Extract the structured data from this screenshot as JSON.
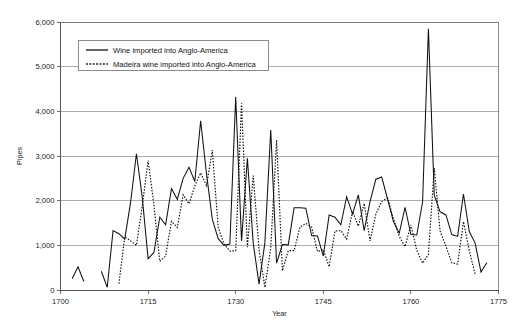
{
  "chart_data": {
    "type": "line",
    "title": "",
    "xlabel": "Year",
    "ylabel": "Pipes",
    "xlim": [
      1700,
      1775
    ],
    "ylim": [
      0,
      6000
    ],
    "grid": true,
    "legend_position": "top-left-inside",
    "xticks": [
      1700,
      1715,
      1730,
      1745,
      1760,
      1775
    ],
    "xtick_labels": [
      "1700",
      "1715",
      "1730",
      "1745",
      "1760",
      "1775"
    ],
    "yticks": [
      0,
      1000,
      2000,
      3000,
      4000,
      5000,
      6000
    ],
    "ytick_labels": [
      "0",
      "1,000",
      "2,000",
      "3,000",
      "4,000",
      "5,000",
      "6,000"
    ],
    "series": [
      {
        "name": "Wine imported into Anglo-America",
        "style": "solid",
        "segments": [
          {
            "x": [
              1702,
              1703,
              1704
            ],
            "values": [
              250,
              520,
              190
            ]
          },
          {
            "x": [
              1707,
              1708,
              1709,
              1710,
              1711,
              1712,
              1713,
              1714,
              1715,
              1716,
              1717,
              1718,
              1719,
              1720,
              1721,
              1722,
              1723,
              1724,
              1725,
              1726,
              1727,
              1728,
              1729,
              1730,
              1731,
              1732,
              1733,
              1734,
              1735,
              1736,
              1737,
              1738,
              1739,
              1740,
              1741,
              1742,
              1743,
              1744,
              1745,
              1746,
              1747,
              1748,
              1749,
              1750,
              1751,
              1752,
              1753,
              1754,
              1755,
              1756,
              1757,
              1758,
              1759,
              1760,
              1761,
              1762,
              1763,
              1764,
              1765,
              1766,
              1767,
              1768,
              1769,
              1770,
              1771,
              1772,
              1773
            ],
            "values": [
              420,
              60,
              1330,
              1260,
              1140,
              1960,
              3050,
              2080,
              700,
              840,
              1630,
              1460,
              2270,
              2030,
              2500,
              2750,
              2430,
              3790,
              2600,
              1580,
              1150,
              1000,
              1030,
              4320,
              1100,
              2950,
              1050,
              130,
              1060,
              3580,
              600,
              1020,
              1010,
              1840,
              1840,
              1830,
              1220,
              1210,
              760,
              1680,
              1630,
              1460,
              2090,
              1700,
              2130,
              1330,
              1980,
              2480,
              2530,
              2040,
              1540,
              1270,
              1850,
              1240,
              1230,
              1970,
              5850,
              2120,
              1750,
              1680,
              1240,
              1200,
              2150,
              1310,
              1050,
              400,
              610
            ]
          }
        ]
      },
      {
        "name": "Madeira wine imported into Anglo-America",
        "style": "dotted",
        "segments": [
          {
            "x": [
              1710,
              1711,
              1712,
              1713,
              1714,
              1715,
              1716,
              1717,
              1718,
              1719,
              1720,
              1721,
              1722,
              1723,
              1724,
              1725,
              1726,
              1727,
              1728,
              1729,
              1730,
              1731,
              1732,
              1733,
              1734,
              1735,
              1736,
              1737,
              1738,
              1739,
              1740,
              1741,
              1742,
              1743,
              1744,
              1745,
              1746,
              1747,
              1748,
              1749,
              1750,
              1751,
              1752,
              1753,
              1754,
              1755,
              1756,
              1757,
              1758,
              1759,
              1760,
              1761,
              1762,
              1763,
              1764,
              1765,
              1766,
              1767,
              1768,
              1769,
              1770,
              1771
            ],
            "values": [
              140,
              1190,
              1100,
              1000,
              1880,
              2900,
              1900,
              640,
              760,
              1540,
              1400,
              2130,
              1930,
              2330,
              2620,
              2340,
              3130,
              1400,
              1030,
              870,
              880,
              4180,
              960,
              2560,
              900,
              60,
              940,
              3360,
              430,
              880,
              880,
              1410,
              1490,
              1410,
              860,
              900,
              520,
              1320,
              1330,
              1140,
              1760,
              1430,
              1940,
              1100,
              1700,
              1980,
              2060,
              1600,
              1200,
              970,
              1460,
              890,
              600,
              800,
              2730,
              1320,
              980,
              610,
              580,
              1530,
              880,
              350
            ]
          }
        ]
      }
    ]
  },
  "legend": {
    "entries": [
      {
        "label": "Wine imported into Anglo-America",
        "style": "solid"
      },
      {
        "label": "Madeira wine imported into Anglo-America",
        "style": "dotted"
      }
    ]
  }
}
